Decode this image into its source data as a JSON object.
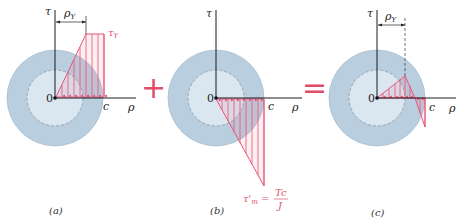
{
  "colors": {
    "outer_ring": "#b9cedf",
    "inner_core": "#dae7f1",
    "stress": "#e8547a",
    "axis": "#1a1a1a",
    "operator": "#df4e6c"
  },
  "operators": {
    "plus": "+",
    "equals": "="
  },
  "panels": [
    {
      "id": "a",
      "caption": "(a)",
      "axis_tau": "τ",
      "axis_rho": "ρ",
      "origin": "0",
      "c_label": "c",
      "dimension_label": "ρY",
      "dimension_label_base": "ρ",
      "dimension_label_sub": "Y",
      "stress_label": "τY",
      "stress_label_base": "τ",
      "stress_label_sub": "Y",
      "description": "Elastoplastic shear stress distribution: linear up to ρY then constant τY to c"
    },
    {
      "id": "b",
      "caption": "(b)",
      "axis_tau": "τ",
      "axis_rho": "ρ",
      "origin": "0",
      "c_label": "c",
      "stress_label": "τ'm = Tc/J",
      "stress_label_base": "τ'",
      "stress_label_sub": "m",
      "stress_label_eq": "=",
      "fraction_num": "Tc",
      "fraction_den": "J",
      "description": "Elastic unloading stress distribution (negative linear) reaching τ'm at c"
    },
    {
      "id": "c",
      "caption": "(c)",
      "axis_tau": "τ",
      "axis_rho": "ρ",
      "origin": "0",
      "c_label": "c",
      "dimension_label": "ρY",
      "dimension_label_base": "ρ",
      "dimension_label_sub": "Y",
      "description": "Residual stress distribution after unloading"
    }
  ]
}
